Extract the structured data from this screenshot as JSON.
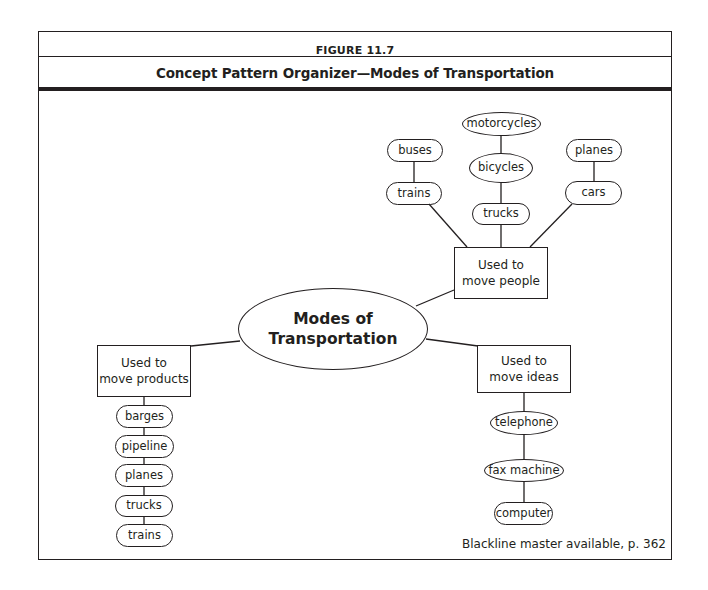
{
  "figure": {
    "number": "FIGURE 11.7",
    "title": "Concept Pattern Organizer—Modes of Transportation",
    "footer": "Blackline master available, p. 362"
  },
  "diagram": {
    "center": {
      "line1": "Modes of",
      "line2": "Transportation"
    },
    "categories": {
      "people": {
        "line1": "Used to",
        "line2": "move people",
        "branches": [
          {
            "items": [
              "buses",
              "trains"
            ]
          },
          {
            "items": [
              "motorcycles",
              "bicycles",
              "trucks"
            ]
          },
          {
            "items": [
              "planes",
              "cars"
            ]
          }
        ]
      },
      "products": {
        "line1": "Used to",
        "line2": "move products",
        "items": [
          "barges",
          "pipeline",
          "planes",
          "trucks",
          "trains"
        ]
      },
      "ideas": {
        "line1": "Used to",
        "line2": "move ideas",
        "items": [
          "telephone",
          "fax machine",
          "computer"
        ]
      }
    }
  }
}
